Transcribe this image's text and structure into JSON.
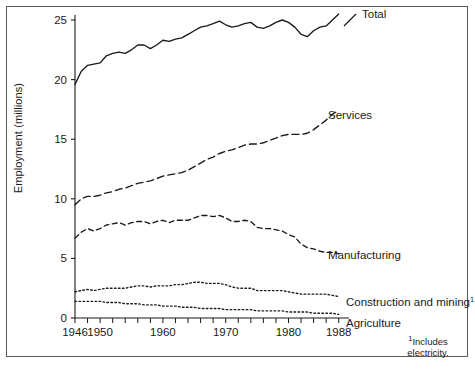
{
  "figure": {
    "frame": true,
    "background": "#ffffff",
    "ink_color": "#1a1a1a"
  },
  "axis": {
    "y_label": "Employment (millions)",
    "y_ticks": [
      "0",
      "5",
      "10",
      "15",
      "20",
      "25"
    ],
    "x_ticks_labeled": [
      "1946",
      "1950",
      "1960",
      "1970",
      "1980",
      "1988"
    ]
  },
  "footnote": {
    "marker": "1",
    "line1": "Includes",
    "line2": "electricity."
  },
  "series_labels": {
    "total": "Total",
    "services": "Services",
    "manufacturing": "Manufacturing",
    "construction": "Construction and mining",
    "construction_sup": "1",
    "agriculture": "Agriculture"
  },
  "chart_data": {
    "type": "line",
    "title": "",
    "xlabel": "",
    "ylabel": "Employment (millions)",
    "xlim": [
      1946,
      1989
    ],
    "ylim": [
      0,
      25
    ],
    "grid": false,
    "legend": "inline-right-of-line-ends",
    "x": [
      1946,
      1947,
      1948,
      1949,
      1950,
      1951,
      1952,
      1953,
      1954,
      1955,
      1956,
      1957,
      1958,
      1959,
      1960,
      1961,
      1962,
      1963,
      1964,
      1965,
      1966,
      1967,
      1968,
      1969,
      1970,
      1971,
      1972,
      1973,
      1974,
      1975,
      1976,
      1977,
      1978,
      1979,
      1980,
      1981,
      1982,
      1983,
      1984,
      1985,
      1986,
      1987,
      1988
    ],
    "series": [
      {
        "name": "Total",
        "style": "solid",
        "values": [
          19.6,
          20.7,
          21.2,
          21.3,
          21.4,
          22.0,
          22.2,
          22.3,
          22.2,
          22.5,
          22.9,
          22.9,
          22.6,
          22.9,
          23.3,
          23.2,
          23.4,
          23.5,
          23.8,
          24.1,
          24.4,
          24.5,
          24.7,
          24.9,
          24.6,
          24.4,
          24.5,
          24.7,
          24.8,
          24.4,
          24.3,
          24.5,
          24.8,
          25.0,
          24.8,
          24.4,
          23.8,
          23.6,
          24.1,
          24.4,
          24.5,
          25.0,
          25.5
        ]
      },
      {
        "name": "Services",
        "style": "dashed-long",
        "values": [
          9.5,
          10.0,
          10.2,
          10.2,
          10.3,
          10.5,
          10.6,
          10.8,
          10.9,
          11.1,
          11.3,
          11.4,
          11.5,
          11.7,
          11.9,
          12.0,
          12.1,
          12.2,
          12.4,
          12.7,
          13.0,
          13.3,
          13.5,
          13.8,
          14.0,
          14.1,
          14.3,
          14.5,
          14.6,
          14.6,
          14.7,
          14.9,
          15.1,
          15.3,
          15.4,
          15.4,
          15.4,
          15.5,
          15.8,
          16.2,
          16.6,
          17.1,
          17.4
        ]
      },
      {
        "name": "Manufacturing",
        "style": "dashed-medium",
        "values": [
          6.7,
          7.2,
          7.5,
          7.3,
          7.5,
          7.8,
          7.9,
          8.0,
          7.8,
          8.0,
          8.1,
          8.1,
          7.9,
          8.1,
          8.2,
          8.0,
          8.2,
          8.2,
          8.2,
          8.4,
          8.6,
          8.6,
          8.5,
          8.6,
          8.4,
          8.1,
          8.1,
          8.2,
          8.1,
          7.6,
          7.5,
          7.5,
          7.4,
          7.3,
          7.0,
          6.8,
          6.2,
          5.9,
          5.8,
          5.6,
          5.5,
          5.5,
          5.4
        ]
      },
      {
        "name": "Construction and mining",
        "style": "dotted",
        "values": [
          2.2,
          2.3,
          2.4,
          2.3,
          2.4,
          2.5,
          2.5,
          2.5,
          2.5,
          2.6,
          2.7,
          2.7,
          2.6,
          2.7,
          2.7,
          2.7,
          2.8,
          2.8,
          2.9,
          3.0,
          3.0,
          2.9,
          2.9,
          2.9,
          2.8,
          2.6,
          2.5,
          2.5,
          2.5,
          2.3,
          2.3,
          2.3,
          2.3,
          2.3,
          2.2,
          2.1,
          2.0,
          2.0,
          2.0,
          2.0,
          2.0,
          1.9,
          1.8
        ]
      },
      {
        "name": "Agriculture",
        "style": "dotted",
        "values": [
          1.4,
          1.4,
          1.4,
          1.4,
          1.4,
          1.3,
          1.3,
          1.3,
          1.2,
          1.2,
          1.2,
          1.1,
          1.1,
          1.1,
          1.0,
          1.0,
          1.0,
          0.9,
          0.9,
          0.9,
          0.8,
          0.8,
          0.8,
          0.8,
          0.7,
          0.7,
          0.7,
          0.7,
          0.7,
          0.6,
          0.6,
          0.6,
          0.6,
          0.6,
          0.5,
          0.5,
          0.5,
          0.5,
          0.4,
          0.4,
          0.4,
          0.4,
          0.3
        ]
      }
    ]
  }
}
